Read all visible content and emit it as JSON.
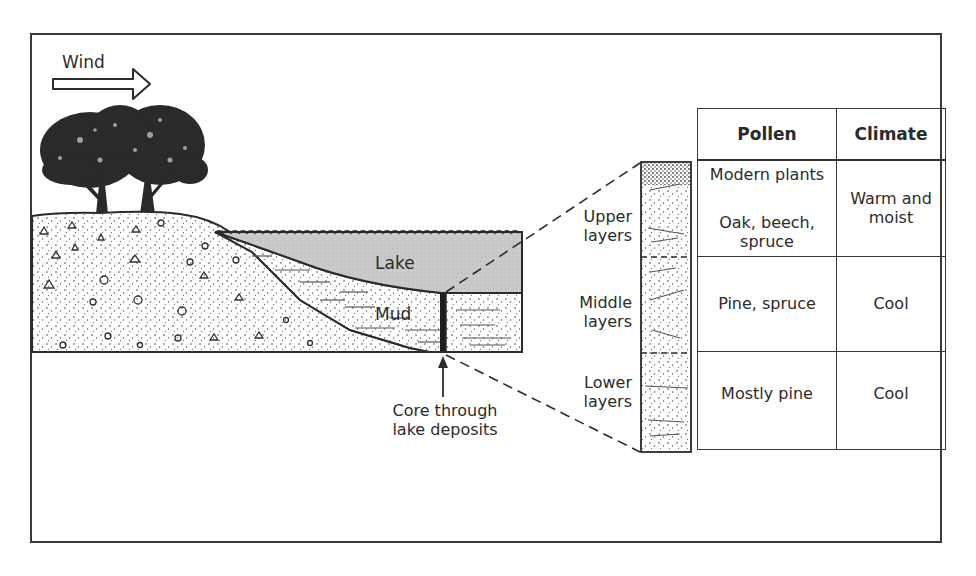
{
  "diagram": {
    "wind": {
      "label": "Wind",
      "icon": "outline-arrow-right-icon"
    },
    "scene": {
      "lake_label": "Lake",
      "mud_label": "Mud",
      "core_caption_line1": "Core through",
      "core_caption_line2": "lake deposits"
    },
    "core_layers": [
      {
        "line1": "Upper",
        "line2": "layers"
      },
      {
        "line1": "Middle",
        "line2": "layers"
      },
      {
        "line1": "Lower",
        "line2": "layers"
      }
    ],
    "table": {
      "headers": [
        "Pollen",
        "Climate"
      ],
      "rows": [
        {
          "pollen": [
            "Modern plants",
            "Oak, beech, spruce"
          ],
          "climate": "Warm and moist"
        },
        {
          "pollen": [
            "Pine, spruce"
          ],
          "climate": "Cool"
        },
        {
          "pollen": [
            "Mostly pine"
          ],
          "climate": "Cool"
        }
      ]
    },
    "colors": {
      "frame": "#3a3a3a",
      "lake_fill": "#c9c9c9",
      "ink": "#2b2b2b",
      "ground_fill": "#ffffff"
    }
  }
}
